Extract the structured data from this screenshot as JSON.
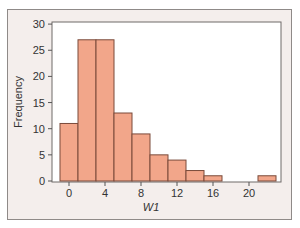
{
  "chart_data": {
    "type": "bar",
    "title": "",
    "xlabel": "W1",
    "ylabel": "Frequency",
    "bin_edges": [
      -1,
      1,
      3,
      5,
      7,
      9,
      11,
      13,
      15,
      17,
      19,
      21,
      23
    ],
    "categories": [
      "-1–1",
      "1–3",
      "3–5",
      "5–7",
      "7–9",
      "9–11",
      "11–13",
      "13–15",
      "15–17",
      "17–19",
      "19–21",
      "21–23"
    ],
    "values": [
      11,
      27,
      27,
      13,
      9,
      5,
      4,
      2,
      1,
      0,
      0,
      1
    ],
    "xticks": [
      0,
      4,
      8,
      12,
      16,
      20
    ],
    "yticks": [
      0,
      5,
      10,
      15,
      20,
      25,
      30
    ],
    "xlim": [
      -2,
      24
    ],
    "ylim": [
      0,
      30
    ],
    "grid": false,
    "legend": null,
    "colors": {
      "bar_fill": "#f2a68a",
      "bar_edge": "#7a4a3a",
      "panel_bg": "#f4eeec",
      "plot_bg": "#ffffff"
    }
  }
}
